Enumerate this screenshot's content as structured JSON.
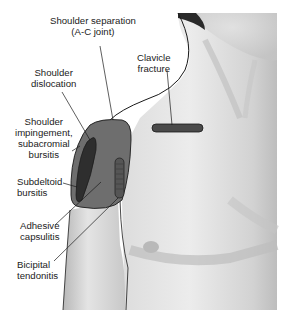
{
  "figure": {
    "colors": {
      "background": "#ffffff",
      "skin_light": "#e6e6e6",
      "skin_mid": "#cfcfcf",
      "skin_shadow": "#a9a9a9",
      "deltoid_region": "#6e6e6e",
      "dislocation_region": "#3a3a3a",
      "lesion_dark": "#4a4a4a",
      "outline": "#1a1a1a"
    }
  },
  "labels": [
    {
      "id": "shoulder-separation",
      "text": "Shoulder separation\n(A-C joint)"
    },
    {
      "id": "clavicle-fracture",
      "text": "Clavicle\nfracture"
    },
    {
      "id": "shoulder-dislocation",
      "text": "Shoulder\ndislocation"
    },
    {
      "id": "shoulder-impingement",
      "text": "Shoulder\nimpingement,\nsubacromial\nbursitis"
    },
    {
      "id": "subdeltoid-bursitis",
      "text": "Subdeltoid\nbursitis"
    },
    {
      "id": "adhesive-capsulitis",
      "text": "Adhesive\ncapsulitis"
    },
    {
      "id": "bicipital-tendonitis",
      "text": "Bicipital\ntendonitis"
    }
  ]
}
